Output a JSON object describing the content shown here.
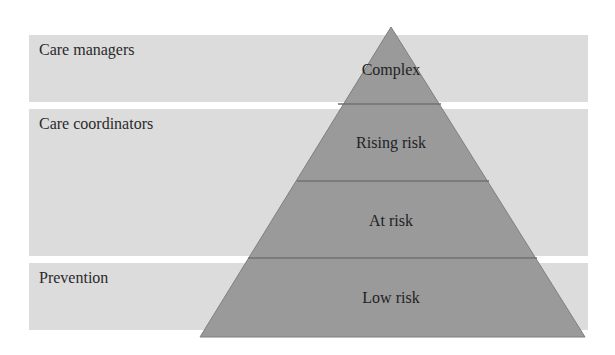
{
  "diagram": {
    "bands": [
      {
        "label": "Care managers",
        "top": 35,
        "height": 67
      },
      {
        "label": "Care coordinators",
        "top": 109,
        "height": 147
      },
      {
        "label": "Prevention",
        "top": 263,
        "height": 67
      }
    ],
    "pyramid": {
      "tiers": [
        {
          "label": "Complex"
        },
        {
          "label": "Rising risk"
        },
        {
          "label": "At risk"
        },
        {
          "label": "Low risk"
        }
      ]
    },
    "colors": {
      "band": "#dcdcdc",
      "pyramid_fill": "#9a9a9a",
      "pyramid_stroke": "#7a7a7a",
      "text": "#222222"
    }
  }
}
